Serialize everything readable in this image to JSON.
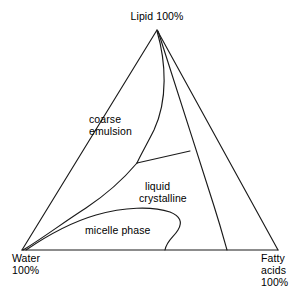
{
  "diagram": {
    "type": "ternary-phase-diagram",
    "vertices": {
      "top": "Lipid 100%",
      "bottom_left_line1": "Water",
      "bottom_left_line2": "100%",
      "bottom_right_line1": "Fatty",
      "bottom_right_line2": "acids",
      "bottom_right_line3": "100%"
    },
    "regions": {
      "coarse_emulsion_line1": "coarse",
      "coarse_emulsion_line2": "emulsion",
      "liquid_crystalline_line1": "liquid",
      "liquid_crystalline_line2": "crystalline",
      "micelle_phase": "micelle phase"
    },
    "colors": {
      "stroke": "#1a1a1a",
      "text": "#000000",
      "background": "#ffffff"
    }
  }
}
